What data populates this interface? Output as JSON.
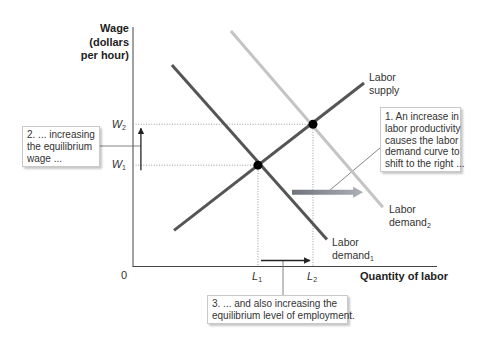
{
  "figure": {
    "y_axis_label": [
      "Wage",
      "(dollars",
      "per hour)"
    ],
    "x_axis_label": "Quantity of labor",
    "origin": "0",
    "y_ticks": [
      {
        "main": "W",
        "sub": "2"
      },
      {
        "main": "W",
        "sub": "1"
      }
    ],
    "x_ticks": [
      {
        "main": "L",
        "sub": "1"
      },
      {
        "main": "L",
        "sub": "2"
      }
    ],
    "curve_labels": {
      "supply": {
        "line1": "Labor",
        "line2": "supply"
      },
      "demand1": {
        "line1": "Labor",
        "line2": "demand",
        "sub": "1"
      },
      "demand2": {
        "line1": "Labor",
        "line2": "demand",
        "sub": "2"
      }
    },
    "callouts": [
      {
        "id": "1",
        "lines": [
          "1. An increase in",
          "labor productivity",
          "causes the labor",
          "demand curve to",
          "shift to the right ..."
        ]
      },
      {
        "id": "2",
        "lines": [
          "2. ... increasing",
          "the equilibrium",
          "wage ..."
        ]
      },
      {
        "id": "3",
        "lines": [
          "3. ... and also increasing the",
          "equilibrium level of employment."
        ]
      }
    ]
  },
  "chart_data": {
    "type": "line",
    "title": "",
    "xlabel": "Quantity of labor",
    "ylabel": "Wage (dollars per hour)",
    "origin_label": "0",
    "xlim": [
      0,
      100
    ],
    "ylim": [
      0,
      100
    ],
    "grid": false,
    "legend": "none (curves labeled directly)",
    "series": [
      {
        "name": "Labor supply",
        "points": [
          [
            13.5,
            15.1
          ],
          [
            76.0,
            76.6
          ]
        ],
        "color": "#555555"
      },
      {
        "name": "Labor demand1",
        "points": [
          [
            12.8,
            84.1
          ],
          [
            63.8,
            11.3
          ]
        ],
        "color": "#555555"
      },
      {
        "name": "Labor demand2",
        "points": [
          [
            32.2,
            98.3
          ],
          [
            82.2,
            24.7
          ]
        ],
        "color": "#c4c4c4"
      }
    ],
    "equilibria": [
      {
        "x": 41.1,
        "y": 42.3,
        "x_tick": "L1",
        "y_tick": "W1"
      },
      {
        "x": 59.2,
        "y": 59.4,
        "x_tick": "L2",
        "y_tick": "W2"
      }
    ],
    "annotations": [
      {
        "type": "shift-arrow",
        "text": "Labor demand curve shifts right",
        "from": [
          52.3,
          31.0
        ],
        "to": [
          75.7,
          31.0
        ],
        "colors": [
          "#70737c",
          "#adb0b6"
        ]
      },
      {
        "type": "arrow",
        "text": "Wage increases W1 to W2",
        "from": [
          2.6,
          40.2
        ],
        "to": [
          2.6,
          57.7
        ]
      },
      {
        "type": "arrow",
        "text": "Employment increases L1 to L2",
        "from": [
          42.1,
          2.5
        ],
        "to": [
          58.2,
          2.5
        ]
      }
    ]
  }
}
